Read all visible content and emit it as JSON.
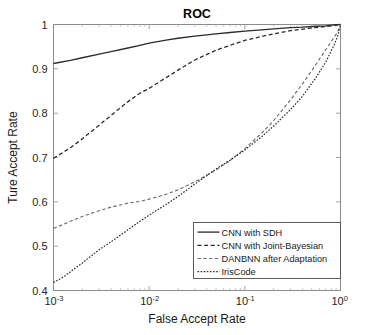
{
  "chart_data": {
    "type": "line",
    "title": "ROC",
    "xlabel": "False Accept Rate",
    "ylabel": "Ture Accept Rate",
    "xscale": "log",
    "yscale": "linear",
    "xlim": [
      0.001,
      1.0
    ],
    "ylim": [
      0.4,
      1.0
    ],
    "grid": false,
    "legend_position": "lower right",
    "xticks": [
      {
        "value": 0.001,
        "label": "10",
        "exponent": "-3"
      },
      {
        "value": 0.01,
        "label": "10",
        "exponent": "-2"
      },
      {
        "value": 0.1,
        "label": "10",
        "exponent": "-1"
      },
      {
        "value": 1.0,
        "label": "10",
        "exponent": "0"
      }
    ],
    "yticks": [
      {
        "value": 0.4,
        "label": "0.4"
      },
      {
        "value": 0.5,
        "label": "0.5"
      },
      {
        "value": 0.6,
        "label": "0.6"
      },
      {
        "value": 0.7,
        "label": "0.7"
      },
      {
        "value": 0.8,
        "label": "0.8"
      },
      {
        "value": 0.9,
        "label": "0.9"
      },
      {
        "value": 1.0,
        "label": "1"
      }
    ],
    "series": [
      {
        "name": "CNN with SDH",
        "style": "solid",
        "color": "#2b2b2b",
        "width": 1.3,
        "dasharray": "",
        "x": [
          0.001,
          0.0015,
          0.002,
          0.003,
          0.004,
          0.006,
          0.008,
          0.01,
          0.015,
          0.02,
          0.03,
          0.05,
          0.07,
          0.1,
          0.15,
          0.2,
          0.3,
          0.4,
          0.55,
          0.7,
          0.85,
          1.0
        ],
        "y": [
          0.912,
          0.919,
          0.925,
          0.933,
          0.939,
          0.947,
          0.953,
          0.958,
          0.965,
          0.969,
          0.974,
          0.979,
          0.982,
          0.985,
          0.988,
          0.99,
          0.993,
          0.994,
          0.996,
          0.997,
          0.999,
          1.0
        ]
      },
      {
        "name": "CNN with Joint-Bayesian",
        "style": "dashed",
        "color": "#2b2b2b",
        "width": 1.3,
        "dasharray": "4,2.6",
        "x": [
          0.001,
          0.0015,
          0.002,
          0.003,
          0.004,
          0.006,
          0.008,
          0.01,
          0.015,
          0.02,
          0.03,
          0.05,
          0.07,
          0.1,
          0.15,
          0.2,
          0.3,
          0.45,
          0.6,
          0.8,
          1.0
        ],
        "y": [
          0.698,
          0.722,
          0.742,
          0.773,
          0.795,
          0.826,
          0.845,
          0.856,
          0.88,
          0.897,
          0.92,
          0.942,
          0.953,
          0.964,
          0.973,
          0.979,
          0.986,
          0.991,
          0.994,
          0.997,
          1.0
        ]
      },
      {
        "name": "DANBNN after Adaptation",
        "style": "dashed-light",
        "color": "#6e6e6e",
        "width": 1.15,
        "dasharray": "3.4,2.4",
        "x": [
          0.001,
          0.0015,
          0.002,
          0.003,
          0.004,
          0.006,
          0.008,
          0.01,
          0.015,
          0.02,
          0.03,
          0.05,
          0.07,
          0.1,
          0.15,
          0.2,
          0.3,
          0.4,
          0.55,
          0.7,
          0.85,
          0.93,
          1.0
        ],
        "y": [
          0.54,
          0.556,
          0.567,
          0.58,
          0.588,
          0.597,
          0.601,
          0.606,
          0.617,
          0.627,
          0.645,
          0.672,
          0.693,
          0.72,
          0.755,
          0.783,
          0.83,
          0.866,
          0.909,
          0.943,
          0.97,
          0.982,
          1.0
        ]
      },
      {
        "name": "IrisCode",
        "style": "dotted",
        "color": "#2b2b2b",
        "width": 1.2,
        "dasharray": "1.6,1.5",
        "x": [
          0.001,
          0.0013,
          0.0017,
          0.002,
          0.003,
          0.004,
          0.006,
          0.008,
          0.01,
          0.015,
          0.02,
          0.03,
          0.05,
          0.07,
          0.1,
          0.15,
          0.2,
          0.3,
          0.4,
          0.55,
          0.7,
          0.85,
          0.93,
          1.0
        ],
        "y": [
          0.418,
          0.432,
          0.451,
          0.462,
          0.492,
          0.51,
          0.537,
          0.556,
          0.57,
          0.594,
          0.612,
          0.64,
          0.674,
          0.694,
          0.717,
          0.747,
          0.771,
          0.808,
          0.838,
          0.879,
          0.915,
          0.952,
          0.972,
          1.0
        ]
      }
    ]
  },
  "legend": {
    "entries": [
      {
        "label": "CNN with SDH"
      },
      {
        "label": "CNN with Joint-Bayesian"
      },
      {
        "label": "DANBNN after Adaptation"
      },
      {
        "label": "IrisCode"
      }
    ]
  }
}
